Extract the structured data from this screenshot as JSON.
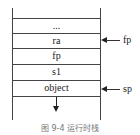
{
  "diagram": {
    "type": "stack-frame",
    "cells": [
      "...",
      "ra",
      "fp",
      "s1",
      "object"
    ],
    "pointers": [
      {
        "label": "fp",
        "points_to": "ra"
      },
      {
        "label": "sp",
        "points_to": "object"
      }
    ],
    "caption": "图 9-4   运行时栈"
  }
}
